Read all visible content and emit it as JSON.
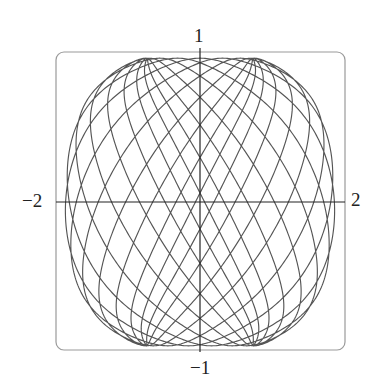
{
  "chart_data": {
    "type": "line",
    "title": "",
    "xlabel": "",
    "ylabel": "",
    "parametric": {
      "x_expr": "1.9*sin(25t) (approximation)",
      "y_expr": "0.96*cos(26t) (approximation)",
      "t_range": [
        0,
        6.2832
      ]
    },
    "xlim": [
      -2,
      2
    ],
    "ylim": [
      -1,
      1
    ],
    "x_tick_labels": [
      "−2",
      "2"
    ],
    "y_tick_labels": [
      "1",
      "−1"
    ],
    "grid": false,
    "legend": null,
    "frame": "rounded rectangle",
    "line_color": "#555555",
    "axis_color": "#222222"
  },
  "labels": {
    "x_min": "−2",
    "x_max": "2",
    "y_max": "1",
    "y_min": "−1"
  }
}
